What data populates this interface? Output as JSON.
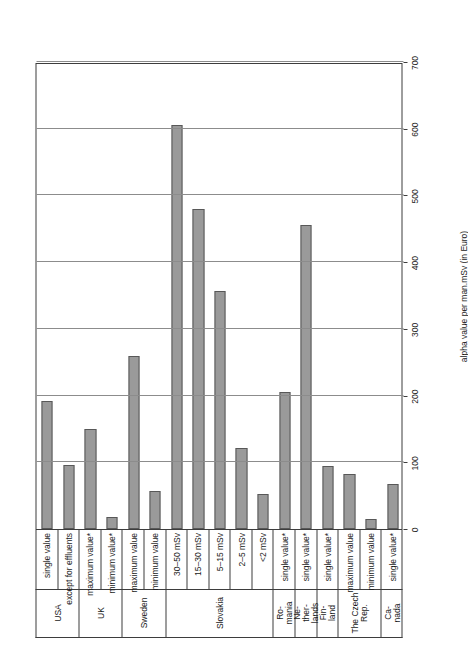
{
  "chart_data": {
    "type": "bar",
    "title": "",
    "subtitle": "",
    "xlabel": "",
    "ylabel": "alpha value per man.mSv (in Euro)",
    "ylim": [
      0,
      700
    ],
    "ytick_values": [
      0,
      100,
      200,
      300,
      400,
      500,
      600,
      700
    ],
    "ytick_labels": [
      "0",
      "100",
      "200",
      "300",
      "400",
      "500",
      "600",
      "700"
    ],
    "grid": true,
    "legend": "none",
    "orientation": "vertical-bars-rotated-90",
    "bar_color": "#9a9a9a",
    "bar_edge_color": "#585858",
    "grid_color": "#8c8c8c",
    "axis_color": "#3d3d3d",
    "categories": [
      "single value",
      "except for effluents",
      "maximum value*",
      "minimum value*",
      "maximum value",
      "minimum value",
      "30–50 mSv",
      "15–30 mSv",
      "5–15 mSv",
      "2–5 mSv",
      "<2 mSv",
      "single value*",
      "single value*",
      "single value*",
      "maximum value",
      "minimum value",
      "single value*"
    ],
    "values": [
      192,
      96,
      150,
      18,
      260,
      57,
      605,
      480,
      357,
      122,
      52,
      205,
      455,
      95,
      83,
      15,
      67
    ],
    "groups": [
      {
        "label": "USA",
        "lines": [
          "USA"
        ],
        "count": 2
      },
      {
        "label": "UK",
        "lines": [
          "UK"
        ],
        "count": 2
      },
      {
        "label": "Sweden",
        "lines": [
          "Sweden"
        ],
        "count": 2
      },
      {
        "label": "Slovakia",
        "lines": [
          "Slovakia"
        ],
        "count": 5
      },
      {
        "label": "Romania",
        "lines": [
          "Ro-",
          "mania"
        ],
        "count": 1
      },
      {
        "label": "Netherlands",
        "lines": [
          "Ne-",
          "ther-",
          "lands"
        ],
        "count": 1
      },
      {
        "label": "Finland",
        "lines": [
          "Fin-",
          "land"
        ],
        "count": 1
      },
      {
        "label": "The Czech Rep.",
        "lines": [
          "The Czech",
          "Rep."
        ],
        "count": 2
      },
      {
        "label": "Canada",
        "lines": [
          "Ca-",
          "nada"
        ],
        "count": 1
      }
    ]
  }
}
